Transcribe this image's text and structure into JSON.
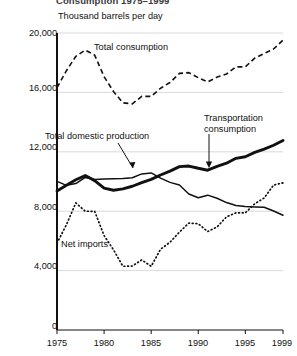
{
  "figure": {
    "title": "Consumption 1975–1999",
    "axis_note": "Thousand barrels per day"
  },
  "chart_data": {
    "type": "line",
    "title": "Consumption 1975–1999",
    "subtitle": "Thousand barrels per day",
    "xlabel": "",
    "ylabel": "Thousand barrels per day",
    "xlim": [
      1975,
      1999
    ],
    "ylim": [
      0,
      20000
    ],
    "grid": true,
    "legend": "inline-annotations",
    "yticks": [
      0,
      4000,
      8000,
      12000,
      16000,
      20000
    ],
    "ytick_labels": [
      "0",
      "4,000",
      "8,000",
      "12,000",
      "16,000",
      "20,000"
    ],
    "xticks": [
      1975,
      1980,
      1985,
      1990,
      1995,
      1999
    ],
    "xtick_labels": [
      "1975",
      "1980",
      "1985",
      "1990",
      "1995",
      "1999"
    ],
    "x": [
      1975,
      1976,
      1977,
      1978,
      1979,
      1980,
      1981,
      1982,
      1983,
      1984,
      1985,
      1986,
      1987,
      1988,
      1989,
      1990,
      1991,
      1992,
      1993,
      1994,
      1995,
      1996,
      1997,
      1998,
      1999
    ],
    "series": [
      {
        "name": "Total consumption",
        "style": "dashed",
        "values": [
          16320,
          17460,
          18430,
          18850,
          18510,
          17060,
          16060,
          15300,
          15230,
          15730,
          15730,
          16280,
          16670,
          17280,
          17330,
          16990,
          16710,
          17030,
          17240,
          17720,
          17720,
          18310,
          18620,
          18920,
          19520
        ]
      },
      {
        "name": "Total domestic production",
        "style": "solid-thin",
        "values": [
          10010,
          9740,
          9860,
          10270,
          10140,
          10170,
          10180,
          10200,
          10250,
          10510,
          10580,
          10230,
          9940,
          9760,
          9160,
          8910,
          9080,
          8870,
          8580,
          8390,
          8320,
          8290,
          8270,
          8010,
          7730
        ]
      },
      {
        "name": "Transportation consumption",
        "style": "solid-thick",
        "values": [
          9360,
          9750,
          10120,
          10400,
          10060,
          9550,
          9410,
          9500,
          9680,
          9920,
          10140,
          10440,
          10700,
          11000,
          11040,
          10890,
          10760,
          11020,
          11230,
          11560,
          11670,
          11960,
          12180,
          12440,
          12760
        ]
      },
      {
        "name": "Net imports",
        "style": "dotted",
        "values": [
          5850,
          7090,
          8560,
          8000,
          7990,
          6360,
          5400,
          4290,
          4310,
          4720,
          4290,
          5440,
          5910,
          6590,
          7200,
          7160,
          6630,
          6940,
          7620,
          7890,
          7890,
          8500,
          8890,
          9760,
          9910
        ]
      }
    ],
    "annotations": [
      {
        "text": "Total consumption",
        "series": "Total consumption"
      },
      {
        "text": "Total domestic production",
        "series": "Total domestic production",
        "leader": "arrow"
      },
      {
        "text": "Transportation consumption",
        "series": "Transportation consumption",
        "leader": "arrow"
      },
      {
        "text": "Net imports",
        "series": "Net imports"
      }
    ]
  }
}
